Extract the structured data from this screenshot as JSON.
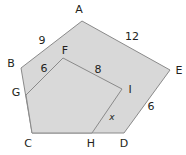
{
  "figure": {
    "fill_color": "#d8d8d8",
    "inner_fill_color": "#d9d9d9",
    "stroke_color": "#8a8a8a",
    "label_color": "#231f20",
    "background_color": "#ffffff"
  },
  "outer_polygon": {
    "name": "pentagon-ABCDE",
    "vertices": [
      {
        "id": "A",
        "x": 82,
        "y": 21
      },
      {
        "id": "E",
        "x": 170,
        "y": 70
      },
      {
        "id": "D",
        "x": 124,
        "y": 133
      },
      {
        "id": "C",
        "x": 32,
        "y": 133
      },
      {
        "id": "B",
        "x": 21,
        "y": 68
      }
    ]
  },
  "inner_polygon": {
    "name": "pentagon-FGCHI",
    "vertices": [
      {
        "id": "F",
        "x": 63,
        "y": 58
      },
      {
        "id": "I",
        "x": 122,
        "y": 89
      },
      {
        "id": "H",
        "x": 92,
        "y": 133
      },
      {
        "id": "C",
        "x": 32,
        "y": 133
      },
      {
        "id": "G",
        "x": 26,
        "y": 95
      }
    ]
  },
  "vertex_labels": [
    {
      "id": "A",
      "text": "A",
      "x": 79,
      "y": 9
    },
    {
      "id": "B",
      "text": "B",
      "x": 11,
      "y": 63
    },
    {
      "id": "E",
      "text": "E",
      "x": 179,
      "y": 70
    },
    {
      "id": "F",
      "text": "F",
      "x": 65,
      "y": 50
    },
    {
      "id": "G",
      "text": "G",
      "x": 16,
      "y": 92
    },
    {
      "id": "I",
      "text": "I",
      "x": 130,
      "y": 89
    },
    {
      "id": "C",
      "text": "C",
      "x": 28,
      "y": 143
    },
    {
      "id": "H",
      "text": "H",
      "x": 91,
      "y": 143
    },
    {
      "id": "D",
      "text": "D",
      "x": 124,
      "y": 143
    }
  ],
  "segment_labels": [
    {
      "id": "AB",
      "text": "9",
      "x": 42,
      "y": 40,
      "italic": false
    },
    {
      "id": "AE",
      "text": "12",
      "x": 132,
      "y": 36,
      "italic": false
    },
    {
      "id": "FG",
      "text": "6",
      "x": 44,
      "y": 68,
      "italic": false
    },
    {
      "id": "FI",
      "text": "8",
      "x": 98,
      "y": 69,
      "italic": false
    },
    {
      "id": "ED",
      "text": "6",
      "x": 151,
      "y": 106,
      "italic": false
    },
    {
      "id": "IH",
      "text": "x",
      "x": 112,
      "y": 117,
      "italic": true
    }
  ],
  "measurements": {
    "AB": 9,
    "AE": 12,
    "FG": 6,
    "FI": 8,
    "ED": 6,
    "IH": "x"
  }
}
